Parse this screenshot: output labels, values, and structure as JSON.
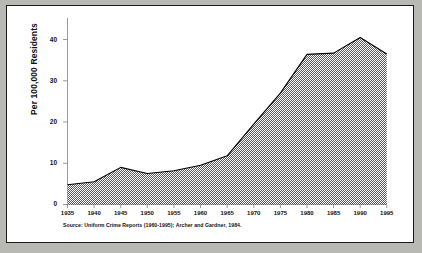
{
  "chart_data": {
    "type": "area",
    "title": "",
    "xlabel": "",
    "ylabel": "Per 100,000 Residents",
    "x": [
      1935,
      1940,
      1945,
      1950,
      1955,
      1960,
      1965,
      1970,
      1975,
      1980,
      1985,
      1990,
      1995
    ],
    "values": [
      4.8,
      5.5,
      9.0,
      7.5,
      8.2,
      9.5,
      11.8,
      19.5,
      27.0,
      36.4,
      36.7,
      40.5,
      36.5
    ],
    "xticks": [
      "1935",
      "1940",
      "1945",
      "1950",
      "1955",
      "1960",
      "1965",
      "1970",
      "1975",
      "1980",
      "1985",
      "1990",
      "1995"
    ],
    "yticks": [
      "0",
      "10",
      "20",
      "30",
      "40"
    ],
    "ytick_values": [
      0,
      10,
      20,
      30,
      40
    ],
    "xlim": [
      1935,
      1995
    ],
    "ylim": [
      0,
      44
    ],
    "grid": false,
    "legend": null,
    "fill": "hatched-gray-dither",
    "fill_color": "#8c8c8c",
    "line_color": "#000000",
    "axis_color": "#888888",
    "series_name": "Rate per 100,000 residents"
  },
  "figure": {
    "source_note": "Source:  Uniform Crime Reports (1960-1995); Archer and Gardner, 1984.",
    "border_color": "#1a1a1a",
    "background": "#ffffff",
    "page_background": "#b9b9b4"
  }
}
